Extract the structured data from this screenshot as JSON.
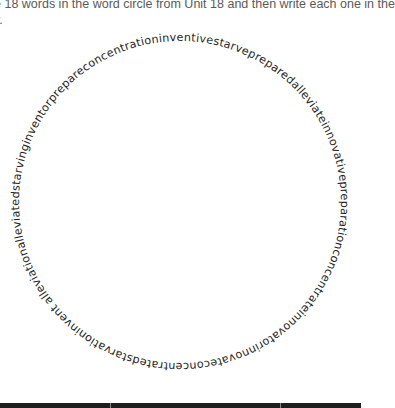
{
  "instructions": {
    "line1": "e 18 words in the word circle from Unit 18 and then write each one in the",
    "line2": "y."
  },
  "word_circle": {
    "text": "alleviationalleviatedstarvinginventorprepareconcentrationinventivestarvepreparedalleviateinnovativepreparationconcentrateinnovatorinnovateconcentratedstarvationinvent",
    "words": [
      "alleviation",
      "alleviated",
      "starving",
      "inventor",
      "prepare",
      "concentration",
      "inventive",
      "starve",
      "prepared",
      "alleviate",
      "innovative",
      "preparation",
      "concentrate",
      "innovator",
      "innovate",
      "concentrated",
      "starvation",
      "invent"
    ],
    "word_count": 18,
    "text_color": "#262626"
  },
  "table": {
    "header_color": "#1e1e1e",
    "columns": [
      "",
      "",
      ""
    ]
  }
}
